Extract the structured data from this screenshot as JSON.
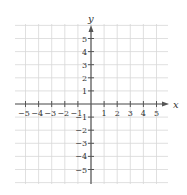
{
  "chart_data": {
    "type": "coordinate-grid",
    "title": "",
    "xlabel": "x",
    "ylabel": "y",
    "xlim": [
      -6,
      6
    ],
    "ylim": [
      -6,
      6
    ],
    "x_ticks": [
      -5,
      -4,
      -3,
      -2,
      -1,
      1,
      2,
      3,
      4,
      5
    ],
    "y_ticks": [
      5,
      4,
      3,
      2,
      1,
      -1,
      -2,
      -3,
      -4,
      -5
    ],
    "x_tick_labels": [
      "−5",
      "−4",
      "−3",
      "−2",
      "−1",
      "1",
      "2",
      "3",
      "4",
      "5"
    ],
    "y_tick_labels": [
      "5",
      "4",
      "3",
      "2",
      "1",
      "−1",
      "−2",
      "−3",
      "−4",
      "−5"
    ],
    "grid": true,
    "series": []
  },
  "colors": {
    "grid": "#d8d8d8",
    "axis": "#555555",
    "text": "#333333"
  }
}
